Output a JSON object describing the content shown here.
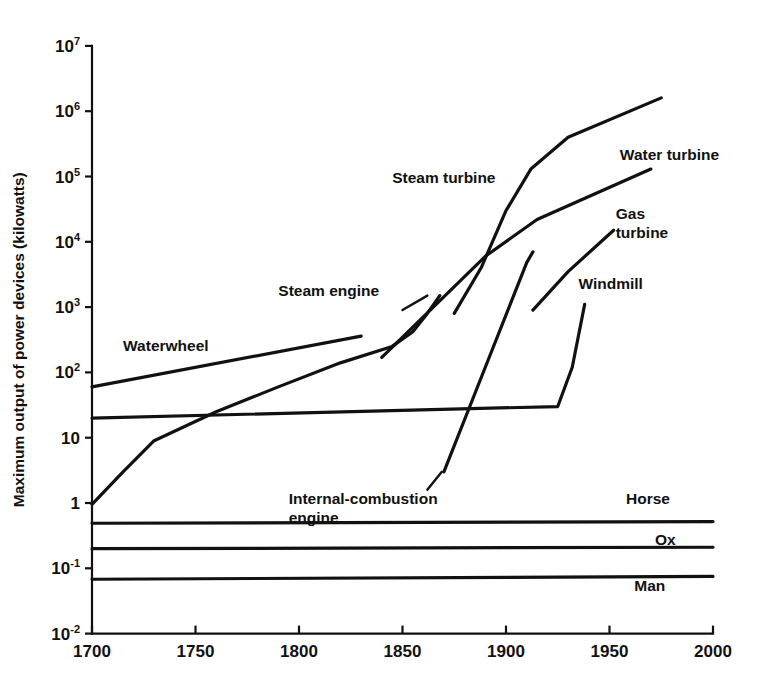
{
  "chart_data": {
    "type": "line",
    "title": "",
    "xlabel": "",
    "ylabel": "Maximum output of power devices (kilowatts)",
    "xlim": [
      1700,
      2000
    ],
    "ylim": [
      0.01,
      10000000
    ],
    "yscale": "log",
    "grid": false,
    "legend_position": "inline-labels",
    "xticks": [
      1700,
      1750,
      1800,
      1850,
      1900,
      1950,
      2000
    ],
    "xticklabels": [
      "1700",
      "1750",
      "1800",
      "1850",
      "1900",
      "1950",
      "2000"
    ],
    "yticks": [
      0.01,
      0.1,
      1,
      10,
      100,
      1000,
      10000,
      100000,
      1000000,
      10000000
    ],
    "yticklabels": [
      "10-2",
      "10-1",
      "1",
      "10",
      "102",
      "103",
      "104",
      "105",
      "106",
      "107"
    ],
    "series": [
      {
        "name": "Waterwheel",
        "label": "Waterwheel",
        "label_x": 1715,
        "label_y": 210,
        "points": [
          [
            1700,
            60
          ],
          [
            1830,
            360
          ]
        ]
      },
      {
        "name": "Steam engine",
        "label": "Steam engine",
        "label_x": 1790,
        "label_y": 1500,
        "leader": [
          [
            1850,
            900
          ],
          [
            1862,
            1500
          ]
        ],
        "points": [
          [
            1700,
            0.95
          ],
          [
            1715,
            3.0
          ],
          [
            1730,
            9.0
          ],
          [
            1745,
            15
          ],
          [
            1760,
            25
          ],
          [
            1790,
            60
          ],
          [
            1820,
            140
          ],
          [
            1845,
            250
          ],
          [
            1855,
            420
          ],
          [
            1862,
            800
          ],
          [
            1868,
            1500
          ]
        ]
      },
      {
        "name": "Windmill",
        "label": "Windmill",
        "label_x": 1935,
        "label_y": 1900,
        "points": [
          [
            1700,
            20
          ],
          [
            1925,
            30
          ],
          [
            1932,
            120
          ],
          [
            1938,
            1100
          ]
        ]
      },
      {
        "name": "Internal-combustion engine",
        "label": "Internal-combustion engine",
        "label_x": 1795,
        "label_y": 0.95,
        "leader": [
          [
            1869,
            3.0
          ],
          [
            1862,
            1.6
          ]
        ],
        "points": [
          [
            1870,
            3.0
          ],
          [
            1890,
            120
          ],
          [
            1910,
            4800
          ],
          [
            1913,
            7000
          ]
        ]
      },
      {
        "name": "Steam turbine",
        "label": "Steam turbine",
        "label_x": 1845,
        "label_y": 80000,
        "points": [
          [
            1875,
            800
          ],
          [
            1888,
            4000
          ],
          [
            1900,
            30000
          ],
          [
            1912,
            130000
          ],
          [
            1930,
            400000
          ],
          [
            1975,
            1600000
          ]
        ]
      },
      {
        "name": "Water turbine",
        "label": "Water turbine",
        "label_x": 1955,
        "label_y": 180000,
        "points": [
          [
            1840,
            170
          ],
          [
            1890,
            6000
          ],
          [
            1915,
            22000
          ],
          [
            1970,
            130000
          ]
        ]
      },
      {
        "name": "Gas turbine",
        "label": "Gas turbine",
        "label_x": 1953,
        "label_y": 22000,
        "points": [
          [
            1913,
            900
          ],
          [
            1930,
            3500
          ],
          [
            1952,
            15000
          ]
        ]
      },
      {
        "name": "Horse",
        "label": "Horse",
        "label_x": 1958,
        "label_y": 0.95,
        "points": [
          [
            1700,
            0.49
          ],
          [
            2000,
            0.52
          ]
        ]
      },
      {
        "name": "Ox",
        "label": "Ox",
        "label_x": 1972,
        "label_y": 0.23,
        "points": [
          [
            1700,
            0.2
          ],
          [
            2000,
            0.21
          ]
        ]
      },
      {
        "name": "Man",
        "label": "Man",
        "label_x": 1962,
        "label_y": 0.045,
        "points": [
          [
            1700,
            0.068
          ],
          [
            2000,
            0.075
          ]
        ]
      }
    ]
  }
}
